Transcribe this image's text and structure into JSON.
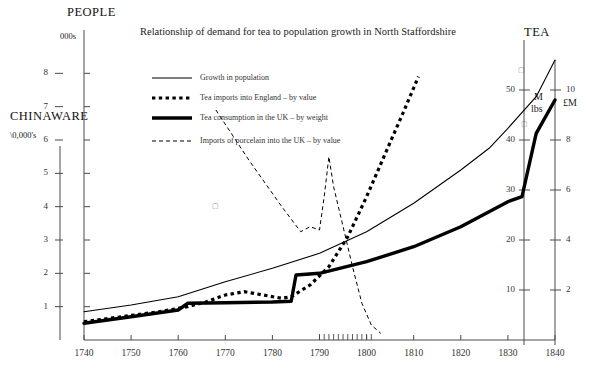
{
  "chart_data": {
    "type": "line",
    "title": "Relationship of demand for tea to population growth in North Staffordshire",
    "xlabel": "",
    "xlim": [
      1740,
      1840
    ],
    "x_ticks": [
      1740,
      1750,
      1760,
      1770,
      1780,
      1790,
      1800,
      1810,
      1820,
      1830,
      1840
    ],
    "x_minor_ticks": [
      1790,
      1791,
      1792,
      1793,
      1794,
      1795,
      1796,
      1797,
      1798,
      1799,
      1800,
      1801
    ],
    "grid": false,
    "legend_position": "top-left-inside",
    "axes": [
      {
        "id": "people",
        "name": "PEOPLE",
        "units": "000s",
        "side": "left-inner",
        "labelled_ticks": [],
        "tick_count": 8
      },
      {
        "id": "chinaware",
        "name": "CHINAWARE",
        "units": "\\0,000's",
        "side": "left-outer",
        "tick_labels": [
          "1",
          "2",
          "3",
          "4",
          "5",
          "6",
          "7",
          "8"
        ],
        "lim": [
          0,
          9
        ]
      },
      {
        "id": "tea_weight",
        "name": "TEA",
        "units": "M lbs",
        "side": "right-inner",
        "tick_labels": [
          "10",
          "20",
          "30",
          "40",
          "50"
        ],
        "lim": [
          0,
          60
        ]
      },
      {
        "id": "tea_value",
        "name": "",
        "units": "£M",
        "side": "right-outer",
        "tick_labels": [
          "2",
          "4",
          "6",
          "8",
          "10"
        ],
        "lim": [
          0,
          12
        ]
      }
    ],
    "series": [
      {
        "name": "Growth in population",
        "key": "population",
        "style": "solid-thin",
        "color": "#000000",
        "points": [
          [
            1740,
            0.85
          ],
          [
            1750,
            1.05
          ],
          [
            1760,
            1.3
          ],
          [
            1770,
            1.75
          ],
          [
            1780,
            2.15
          ],
          [
            1790,
            2.6
          ],
          [
            1800,
            3.25
          ],
          [
            1810,
            4.1
          ],
          [
            1820,
            5.1
          ],
          [
            1826,
            5.75
          ],
          [
            1830,
            6.35
          ],
          [
            1836,
            7.3
          ],
          [
            1840,
            8.4
          ]
        ]
      },
      {
        "name": "Tea imports into England – by value",
        "key": "tea_imports_value",
        "style": "dotted-thick",
        "color": "#000000",
        "points": [
          [
            1740,
            0.55
          ],
          [
            1748,
            0.7
          ],
          [
            1756,
            0.85
          ],
          [
            1762,
            1.0
          ],
          [
            1766,
            1.15
          ],
          [
            1770,
            1.35
          ],
          [
            1774,
            1.45
          ],
          [
            1778,
            1.35
          ],
          [
            1782,
            1.25
          ],
          [
            1784,
            1.3
          ],
          [
            1788,
            1.65
          ],
          [
            1792,
            2.2
          ],
          [
            1796,
            3.1
          ],
          [
            1800,
            4.3
          ],
          [
            1804,
            5.6
          ],
          [
            1808,
            6.9
          ],
          [
            1811,
            7.9
          ]
        ]
      },
      {
        "name": "Tea consumption in the UK – by weight",
        "key": "tea_consumption_weight",
        "style": "solid-thick",
        "color": "#000000",
        "points": [
          [
            1740,
            0.5
          ],
          [
            1750,
            0.7
          ],
          [
            1760,
            0.9
          ],
          [
            1762,
            1.1
          ],
          [
            1770,
            1.12
          ],
          [
            1780,
            1.14
          ],
          [
            1784,
            1.16
          ],
          [
            1785,
            1.95
          ],
          [
            1790,
            2.0
          ],
          [
            1800,
            2.35
          ],
          [
            1810,
            2.8
          ],
          [
            1820,
            3.4
          ],
          [
            1830,
            4.15
          ],
          [
            1833,
            4.3
          ],
          [
            1836,
            6.2
          ],
          [
            1840,
            7.2
          ]
        ]
      },
      {
        "name": "Imports of porcelain into the UK – by value",
        "key": "porcelain_imports_value",
        "style": "dashed-thin",
        "color": "#000000",
        "points": [
          [
            1768,
            6.9
          ],
          [
            1775,
            5.4
          ],
          [
            1782,
            4.0
          ],
          [
            1786,
            3.25
          ],
          [
            1788,
            3.4
          ],
          [
            1790,
            3.3
          ],
          [
            1791,
            4.3
          ],
          [
            1792,
            5.5
          ],
          [
            1793,
            4.6
          ],
          [
            1795,
            3.4
          ],
          [
            1797,
            2.2
          ],
          [
            1799,
            1.1
          ],
          [
            1801,
            0.45
          ],
          [
            1803,
            0.2
          ]
        ]
      }
    ]
  },
  "legend": {
    "items": [
      {
        "label": "Growth in population",
        "swatch": "solid-thin"
      },
      {
        "label": "Tea imports into England – by value",
        "swatch": "dotted-thick"
      },
      {
        "label": "Tea consumption in the UK – by weight",
        "swatch": "solid-thick"
      },
      {
        "label": "Imports of porcelain into the UK – by value",
        "swatch": "dashed-thin"
      }
    ]
  },
  "labels": {
    "people_title": "PEOPLE",
    "people_units": "000s",
    "chinaware_title": "CHINAWARE",
    "chinaware_units": "\\0,000's",
    "tea_title": "TEA",
    "tea_units_weight_line1": "M",
    "tea_units_weight_line2": "lbs",
    "tea_units_value": "£M"
  }
}
